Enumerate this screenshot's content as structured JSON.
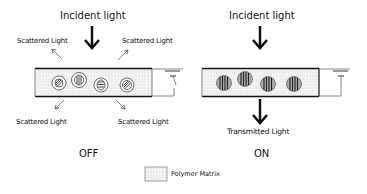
{
  "diagram": {
    "off_panel": {
      "incident_label": "Incident light",
      "scattered_labels": [
        "Scattered Light",
        "Scattered Light",
        "Scattered Light",
        "Scattered Light"
      ],
      "state_label": "OFF",
      "droplets": [
        {
          "orientation": "diagonal"
        },
        {
          "orientation": "vertical"
        },
        {
          "orientation": "horizontal"
        },
        {
          "orientation": "diagonal"
        }
      ]
    },
    "on_panel": {
      "incident_label": "Incident light",
      "transmitted_label": "Transmitted Light",
      "state_label": "ON",
      "droplets": [
        {
          "orientation": "vertical"
        },
        {
          "orientation": "vertical"
        },
        {
          "orientation": "vertical"
        },
        {
          "orientation": "vertical"
        }
      ]
    },
    "legend": {
      "items": [
        {
          "swatch": "dotted-fill",
          "label": "Polymer Matrix"
        }
      ]
    },
    "colors": {
      "line": "#111111",
      "matrix_fill": "#f2f2f2",
      "matrix_dots": "#b8b8b8",
      "droplet_dark": "#555555"
    }
  }
}
